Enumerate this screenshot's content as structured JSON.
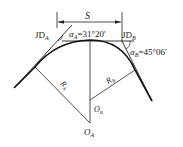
{
  "diagram": {
    "type": "compound-curve",
    "labels": {
      "span": "S",
      "jd_a_main": "JD",
      "jd_a_sub": "A",
      "jd_b_main": "JD",
      "jd_b_sub": "B",
      "alpha_a_sym": "α",
      "alpha_a_sub": "A",
      "alpha_a_val": "=31°20′",
      "alpha_b_sym": "α",
      "alpha_b_sub": "B",
      "alpha_b_val": "=45°06′",
      "radius_a_main": "R",
      "radius_a_sub": "A",
      "radius_b_main": "R",
      "radius_b_sub": "B",
      "center_a_main": "O",
      "center_a_sub": "A",
      "center_b_main": "O",
      "center_b_sub": "B"
    },
    "colors": {
      "line": "#222222",
      "background": "#ffffff"
    }
  }
}
